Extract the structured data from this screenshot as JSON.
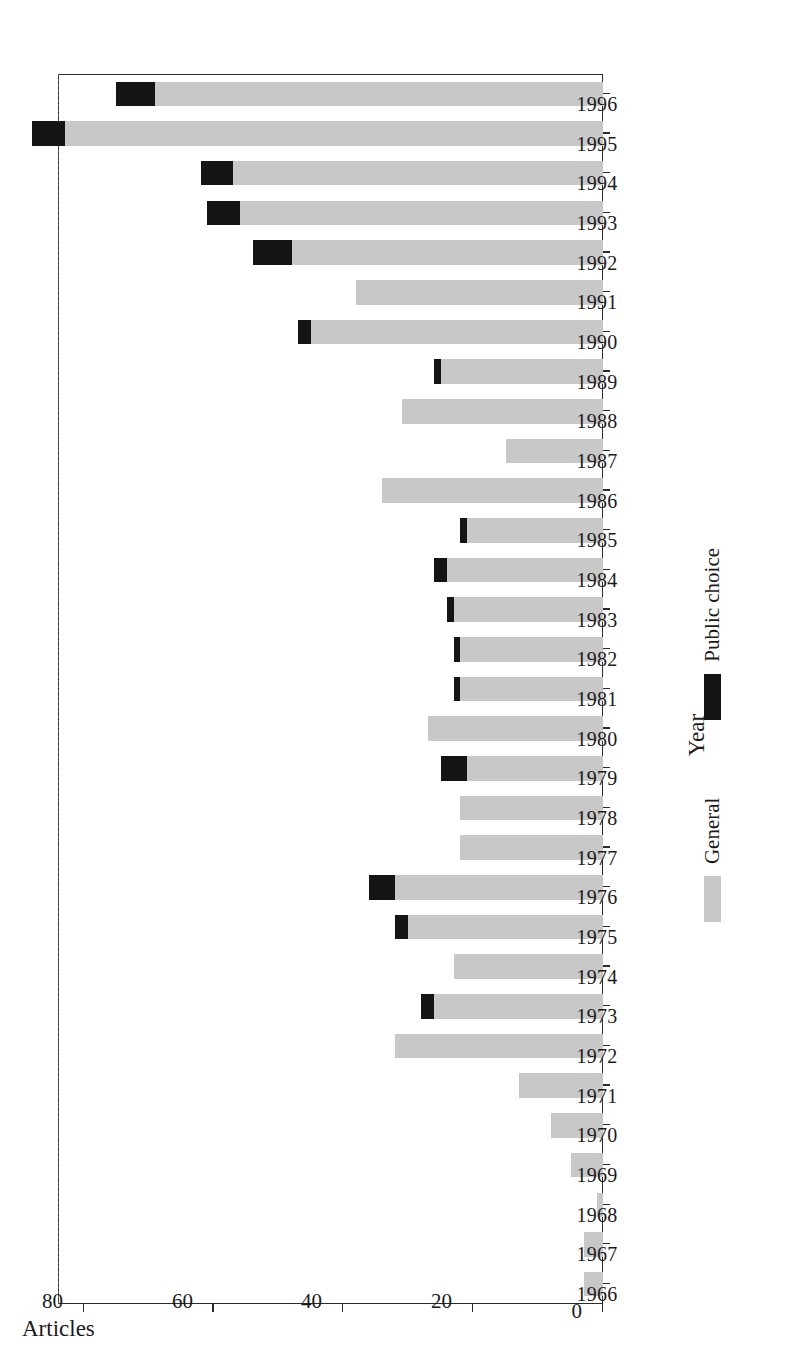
{
  "chart_data": {
    "type": "bar",
    "subtype": "stacked-horizontal",
    "title": "",
    "xlabel": "Year",
    "ylabel": "Articles",
    "ylim": [
      0,
      84
    ],
    "yticks": [
      0,
      20,
      40,
      60,
      80
    ],
    "grid": "dashed vertical gridlines at 20, 40, 60",
    "orientation": "rotated-90-ccw",
    "legend": {
      "position": "below-axis",
      "entries": [
        {
          "name": "General",
          "color": "#c8c8c8"
        },
        {
          "name": "Public choice",
          "color": "#151515"
        }
      ]
    },
    "categories": [
      "1966",
      "1967",
      "1968",
      "1969",
      "1970",
      "1971",
      "1972",
      "1973",
      "1974",
      "1975",
      "1976",
      "1977",
      "1978",
      "1979",
      "1980",
      "1981",
      "1982",
      "1983",
      "1984",
      "1985",
      "1986",
      "1987",
      "1988",
      "1989",
      "1990",
      "1991",
      "1992",
      "1993",
      "1994",
      "1995",
      "1996"
    ],
    "series": [
      {
        "name": "General",
        "color": "#c8c8c8",
        "values": [
          3,
          3,
          1,
          5,
          8,
          13,
          32,
          26,
          23,
          30,
          32,
          22,
          22,
          21,
          27,
          22,
          22,
          23,
          24,
          21,
          34,
          15,
          31,
          25,
          45,
          38,
          48,
          56,
          57,
          83,
          69
        ]
      },
      {
        "name": "Public choice",
        "color": "#151515",
        "values": [
          0,
          0,
          0,
          0,
          0,
          0,
          0,
          2,
          0,
          2,
          4,
          0,
          0,
          4,
          0,
          1,
          1,
          1,
          2,
          1,
          0,
          0,
          0,
          1,
          2,
          0,
          6,
          5,
          5,
          5,
          6
        ]
      }
    ],
    "totals": [
      3,
      3,
      1,
      5,
      8,
      13,
      32,
      28,
      23,
      32,
      36,
      22,
      22,
      25,
      27,
      23,
      23,
      24,
      26,
      22,
      34,
      15,
      31,
      26,
      47,
      38,
      54,
      61,
      62,
      88,
      75
    ]
  },
  "axes": {
    "value_axis_title": "Articles",
    "category_axis_title": "Year",
    "value_ticks": [
      "0",
      "20",
      "40",
      "60",
      "80"
    ]
  },
  "legend": {
    "general_label": "General",
    "public_choice_label": "Public choice"
  },
  "colors": {
    "general": "#c8c8c8",
    "public_choice": "#151515",
    "axis": "#2b2b2b",
    "grid": "#555555",
    "background": "#ffffff"
  }
}
